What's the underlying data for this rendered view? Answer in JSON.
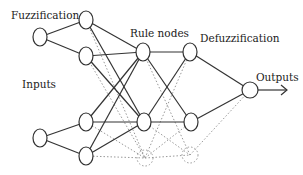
{
  "diagram": {
    "type": "fuzzy neural network",
    "labels": {
      "fuzzification": "Fuzzification",
      "rule_nodes": "Rule nodes",
      "defuzzification": "Defuzzification",
      "inputs": "Inputs",
      "outputs": "Outputs"
    },
    "layers": [
      {
        "name": "inputs",
        "nodes": 2
      },
      {
        "name": "fuzzification",
        "nodes": 4
      },
      {
        "name": "rule nodes",
        "nodes": 3,
        "dotted_nodes": 1
      },
      {
        "name": "defuzzification",
        "nodes": 3,
        "dotted_nodes": 1
      },
      {
        "name": "outputs",
        "nodes": 1
      }
    ],
    "colors": {
      "stroke": "#333333",
      "dotted": "#999999",
      "background": "#ffffff"
    }
  }
}
